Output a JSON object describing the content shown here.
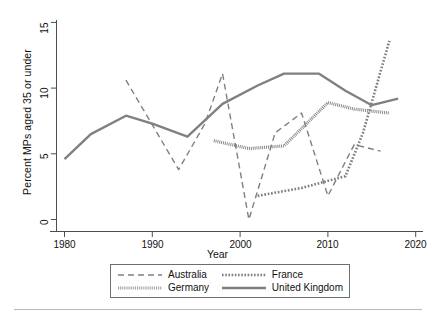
{
  "figure": {
    "background": "#ffffff",
    "line_color": "#808080",
    "axis_color": "#4d4d4d"
  },
  "axes": {
    "y_title": "Percent MPs aged 35 or under",
    "x_title": "Year",
    "y_ticks": [
      "0",
      "5",
      "10",
      "15"
    ],
    "x_ticks": [
      "1980",
      "1990",
      "2000",
      "2010",
      "2020"
    ]
  },
  "legend": {
    "entries": [
      {
        "label": "Australia",
        "style": "dashed",
        "swatch": "legend-swatch-australia"
      },
      {
        "label": "France",
        "style": "dotted",
        "swatch": "legend-swatch-france"
      },
      {
        "label": "Germany",
        "style": "fine-dotted",
        "swatch": "legend-swatch-germany"
      },
      {
        "label": "United Kingdom",
        "style": "solid",
        "swatch": "legend-swatch-uk"
      }
    ]
  },
  "chart_data": {
    "type": "line",
    "title": "",
    "xlabel": "Year",
    "ylabel": "Percent MPs aged 35 or under",
    "xlim": [
      1978,
      2021
    ],
    "ylim": [
      -0.6,
      15.4
    ],
    "y_ticks": [
      0,
      5,
      10,
      15
    ],
    "x_ticks": [
      1980,
      1990,
      2000,
      2010,
      2020
    ],
    "grid": false,
    "legend_position": "below-axes",
    "series": [
      {
        "name": "Australia",
        "style": "dashed",
        "color": "#808080",
        "x": [
          1987,
          1990,
          1993,
          1996,
          1998,
          2001,
          2004,
          2007,
          2010,
          2013,
          2016
        ],
        "y": [
          10.6,
          7.2,
          3.8,
          7.3,
          11.1,
          0.0,
          6.6,
          8.1,
          1.8,
          5.7,
          5.2
        ]
      },
      {
        "name": "France",
        "style": "dotted",
        "color": "#808080",
        "x": [
          2002,
          2007,
          2012,
          2014,
          2017
        ],
        "y": [
          1.8,
          2.4,
          3.3,
          6.6,
          13.6
        ]
      },
      {
        "name": "Germany",
        "style": "fine-dotted",
        "color": "#808080",
        "x": [
          1997,
          2001,
          2005,
          2010,
          2013,
          2017
        ],
        "y": [
          6.0,
          5.4,
          5.6,
          8.9,
          8.4,
          8.1
        ]
      },
      {
        "name": "United Kingdom",
        "style": "solid",
        "color": "#808080",
        "x": [
          1980,
          1983,
          1987,
          1990,
          1994,
          1998,
          2002,
          2005,
          2009,
          2012,
          2015,
          2018
        ],
        "y": [
          4.6,
          6.5,
          7.9,
          7.3,
          6.3,
          8.8,
          10.2,
          11.1,
          11.1,
          9.8,
          8.7,
          9.2
        ]
      }
    ]
  }
}
